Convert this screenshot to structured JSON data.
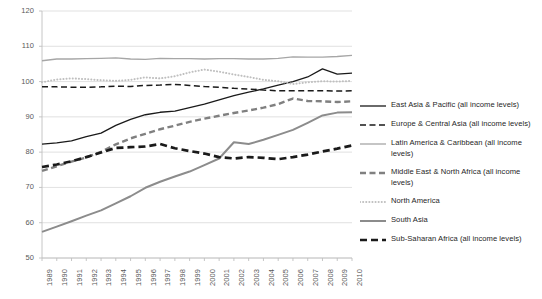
{
  "chart_data": {
    "type": "line",
    "title": "",
    "xlabel": "",
    "ylabel": "",
    "ylim": [
      50,
      120
    ],
    "ytick_step": 10,
    "yticks": [
      50,
      60,
      70,
      80,
      90,
      100,
      110,
      120
    ],
    "grid": true,
    "legend_position": "right",
    "categories": [
      "1989",
      "1990",
      "1991",
      "1992",
      "1993",
      "1994",
      "1995",
      "1996",
      "1997",
      "1998",
      "1999",
      "2000",
      "2001",
      "2002",
      "2003",
      "2004",
      "2005",
      "2006",
      "2007",
      "2008",
      "2009",
      "2010"
    ],
    "series": [
      {
        "name": "East Asia & Pacific (all income levels)",
        "color": "#1a1a1a",
        "style": "solid",
        "width": 1.3,
        "values": [
          82.3,
          82.6,
          83.2,
          84.4,
          85.4,
          87.6,
          89.3,
          90.6,
          91.3,
          91.6,
          92.6,
          93.6,
          94.8,
          96.0,
          97.0,
          97.9,
          99.0,
          100.0,
          101.3,
          103.6,
          102.1,
          102.4
        ]
      },
      {
        "name": "Europe & Central Asia (all income levels)",
        "color": "#1a1a1a",
        "style": "dashed",
        "width": 1.5,
        "values": [
          98.5,
          98.5,
          98.4,
          98.4,
          98.5,
          98.7,
          98.6,
          98.9,
          99.0,
          99.2,
          98.9,
          98.6,
          98.4,
          98.1,
          97.9,
          97.6,
          97.4,
          97.4,
          97.4,
          97.4,
          97.3,
          97.4
        ]
      },
      {
        "name": "Latin America & Caribbean (all income levels)",
        "color": "#a6a6a6",
        "style": "solid",
        "width": 1.3,
        "values": [
          105.9,
          106.4,
          106.4,
          106.5,
          106.6,
          106.7,
          106.4,
          106.3,
          106.6,
          106.5,
          106.5,
          106.4,
          106.5,
          106.5,
          106.4,
          106.4,
          106.6,
          107.0,
          106.9,
          106.9,
          107.1,
          107.4
        ]
      },
      {
        "name": "Middle East & North Africa (all income levels)",
        "color": "#808080",
        "style": "dashed",
        "width": 2.4,
        "values": [
          74.7,
          76.0,
          77.3,
          78.5,
          80.1,
          82.2,
          83.9,
          85.2,
          86.5,
          87.5,
          88.6,
          89.5,
          90.3,
          91.1,
          91.8,
          92.6,
          93.6,
          95.2,
          94.5,
          94.4,
          94.2,
          94.4
        ]
      },
      {
        "name": "North America",
        "color": "#bfbfbf",
        "style": "dotted",
        "width": 2.0,
        "values": [
          99.8,
          100.6,
          100.9,
          100.7,
          100.4,
          100.2,
          100.5,
          101.2,
          100.9,
          101.5,
          102.6,
          103.4,
          102.8,
          102.0,
          101.3,
          100.5,
          100.1,
          99.3,
          99.8,
          100.1,
          100.0,
          100.2
        ]
      },
      {
        "name": "South Asia",
        "color": "#8c8c8c",
        "style": "solid",
        "width": 2.0,
        "values": [
          57.4,
          58.9,
          60.4,
          62.0,
          63.5,
          65.5,
          67.5,
          69.9,
          71.6,
          73.1,
          74.5,
          76.3,
          78.2,
          82.8,
          82.3,
          83.5,
          84.9,
          86.3,
          88.3,
          90.4,
          91.2,
          91.3
        ]
      },
      {
        "name": "Sub-Saharan Africa (all income levels)",
        "color": "#1a1a1a",
        "style": "dashed-thick",
        "width": 2.7,
        "values": [
          75.8,
          76.5,
          77.4,
          78.6,
          79.9,
          81.2,
          81.4,
          81.6,
          82.3,
          81.1,
          80.3,
          79.6,
          78.6,
          78.2,
          78.6,
          78.4,
          78.0,
          78.6,
          79.3,
          80.2,
          81.0,
          81.9
        ]
      }
    ]
  },
  "axis": {
    "y_labels": [
      "120",
      "110",
      "100",
      "90",
      "80",
      "70",
      "60",
      "50"
    ],
    "x_labels": [
      "1989",
      "1990",
      "1991",
      "1992",
      "1993",
      "1994",
      "1995",
      "1996",
      "1997",
      "1998",
      "1999",
      "2000",
      "2001",
      "2002",
      "2003",
      "2004",
      "2005",
      "2006",
      "2007",
      "2008",
      "2009",
      "2010"
    ]
  },
  "legend": {
    "items": [
      {
        "label": "East Asia & Pacific (all income levels)",
        "color": "#1a1a1a",
        "style": "solid",
        "width": 1.3
      },
      {
        "label": "Europe & Central Asia (all income levels)",
        "color": "#1a1a1a",
        "style": "dashed",
        "width": 1.5
      },
      {
        "label": "Latin America & Caribbean (all income levels)",
        "color": "#a6a6a6",
        "style": "solid",
        "width": 1.3
      },
      {
        "label": "Middle East & North Africa (all income levels)",
        "color": "#808080",
        "style": "dashed",
        "width": 2.4
      },
      {
        "label": "North America",
        "color": "#bfbfbf",
        "style": "dotted",
        "width": 2.0
      },
      {
        "label": "South Asia",
        "color": "#8c8c8c",
        "style": "solid",
        "width": 2.0
      },
      {
        "label": "Sub-Saharan Africa (all income levels)",
        "color": "#1a1a1a",
        "style": "dashed-thick",
        "width": 2.7
      }
    ]
  },
  "style": {
    "grid_color": "#d9d9d9",
    "axis_color": "#bfbfbf",
    "tick_text_color": "#595959",
    "legend_text_color": "#262626",
    "background": "#ffffff"
  }
}
